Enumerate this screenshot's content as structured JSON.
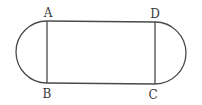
{
  "diagram": {
    "type": "geometry-figure",
    "colors": {
      "stroke": "#4a4a4a",
      "label": "#3a3a3a",
      "background": "#ffffff"
    },
    "points": {
      "A": {
        "label": "A",
        "x": 47,
        "y": 21
      },
      "B": {
        "label": "B",
        "x": 47,
        "y": 83
      },
      "C": {
        "label": "C",
        "x": 155,
        "y": 84
      },
      "D": {
        "label": "D",
        "x": 155,
        "y": 22
      }
    },
    "labels": [
      {
        "id": "A",
        "text": "A",
        "x": 48,
        "y": 17
      },
      {
        "id": "B",
        "text": "B",
        "x": 47,
        "y": 98
      },
      {
        "id": "D",
        "text": "D",
        "x": 155,
        "y": 18
      },
      {
        "id": "C",
        "text": "C",
        "x": 153,
        "y": 99
      }
    ]
  }
}
